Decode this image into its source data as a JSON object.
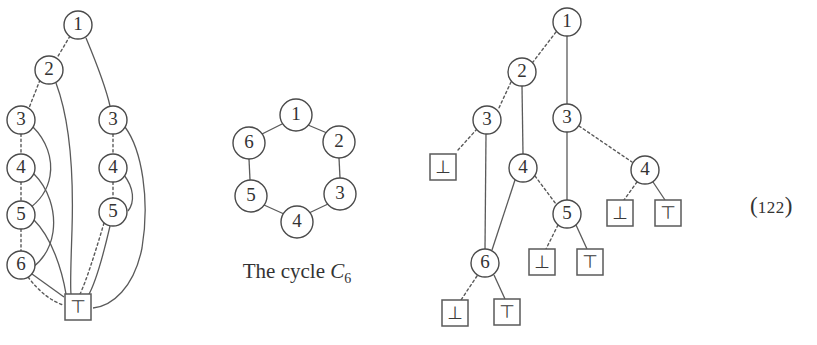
{
  "figure": {
    "equation_number": "(",
    "equation_number_digits": "122",
    "equation_number_close": ")"
  },
  "left_diagram": {
    "name": "bdd-unreduced-cycle-c6",
    "nodes": [
      {
        "id": "L1",
        "label": "1",
        "x": 78,
        "y": 25,
        "r": 14,
        "shape": "circle"
      },
      {
        "id": "L2",
        "label": "2",
        "x": 49,
        "y": 70,
        "r": 14,
        "shape": "circle"
      },
      {
        "id": "L3a",
        "label": "3",
        "x": 21,
        "y": 120,
        "r": 14,
        "shape": "circle"
      },
      {
        "id": "L3b",
        "label": "3",
        "x": 113,
        "y": 120,
        "r": 14,
        "shape": "circle"
      },
      {
        "id": "L4a",
        "label": "4",
        "x": 21,
        "y": 168,
        "r": 14,
        "shape": "circle"
      },
      {
        "id": "L4b",
        "label": "4",
        "x": 113,
        "y": 168,
        "r": 14,
        "shape": "circle"
      },
      {
        "id": "L5a",
        "label": "5",
        "x": 21,
        "y": 215,
        "r": 14,
        "shape": "circle"
      },
      {
        "id": "L5b",
        "label": "5",
        "x": 113,
        "y": 212,
        "r": 14,
        "shape": "circle"
      },
      {
        "id": "L6",
        "label": "6",
        "x": 21,
        "y": 265,
        "r": 14,
        "shape": "circle"
      },
      {
        "id": "LT",
        "label": "⊤",
        "x": 78,
        "y": 307,
        "w": 26,
        "h": 26,
        "shape": "box"
      }
    ]
  },
  "middle_diagram": {
    "name": "cycle-c6-graph",
    "caption_prefix": "The cycle ",
    "caption_symbol": "C",
    "caption_subscript": "6",
    "nodes": [
      {
        "id": "C1",
        "label": "1",
        "x": 296,
        "y": 115,
        "r": 16
      },
      {
        "id": "C2",
        "label": "2",
        "x": 339,
        "y": 142,
        "r": 16
      },
      {
        "id": "C3",
        "label": "3",
        "x": 340,
        "y": 194,
        "r": 16
      },
      {
        "id": "C4",
        "label": "4",
        "x": 297,
        "y": 222,
        "r": 16
      },
      {
        "id": "C5",
        "label": "5",
        "x": 251,
        "y": 196,
        "r": 16
      },
      {
        "id": "C6",
        "label": "6",
        "x": 249,
        "y": 143,
        "r": 16
      }
    ],
    "edges": [
      {
        "from": "C1",
        "to": "C2"
      },
      {
        "from": "C2",
        "to": "C3"
      },
      {
        "from": "C3",
        "to": "C4"
      },
      {
        "from": "C4",
        "to": "C5"
      },
      {
        "from": "C5",
        "to": "C6"
      },
      {
        "from": "C6",
        "to": "C1"
      }
    ]
  },
  "right_diagram": {
    "name": "bdd-reduced-cycle-c6",
    "nodes": [
      {
        "id": "R1",
        "label": "1",
        "x": 567,
        "y": 22,
        "r": 14,
        "shape": "circle"
      },
      {
        "id": "R2",
        "label": "2",
        "x": 522,
        "y": 72,
        "r": 14,
        "shape": "circle"
      },
      {
        "id": "R3a",
        "label": "3",
        "x": 487,
        "y": 120,
        "r": 14,
        "shape": "circle"
      },
      {
        "id": "R3b",
        "label": "3",
        "x": 567,
        "y": 118,
        "r": 14,
        "shape": "circle"
      },
      {
        "id": "R4a",
        "label": "4",
        "x": 523,
        "y": 168,
        "r": 14,
        "shape": "circle"
      },
      {
        "id": "R4b",
        "label": "4",
        "x": 645,
        "y": 170,
        "r": 14,
        "shape": "circle"
      },
      {
        "id": "R5",
        "label": "5",
        "x": 567,
        "y": 214,
        "r": 14,
        "shape": "circle"
      },
      {
        "id": "R6",
        "label": "6",
        "x": 485,
        "y": 263,
        "r": 14,
        "shape": "circle"
      },
      {
        "id": "B1",
        "label": "⊥",
        "x": 443,
        "y": 167,
        "w": 26,
        "h": 26,
        "shape": "box"
      },
      {
        "id": "B2",
        "label": "⊥",
        "x": 620,
        "y": 213,
        "w": 26,
        "h": 26,
        "shape": "box"
      },
      {
        "id": "B3",
        "label": "⊤",
        "x": 668,
        "y": 213,
        "w": 26,
        "h": 26,
        "shape": "box"
      },
      {
        "id": "B4",
        "label": "⊥",
        "x": 542,
        "y": 262,
        "w": 26,
        "h": 26,
        "shape": "box"
      },
      {
        "id": "B5",
        "label": "⊤",
        "x": 590,
        "y": 262,
        "w": 26,
        "h": 26,
        "shape": "box"
      },
      {
        "id": "B6",
        "label": "⊥",
        "x": 455,
        "y": 313,
        "w": 26,
        "h": 26,
        "shape": "box"
      },
      {
        "id": "B7",
        "label": "⊤",
        "x": 507,
        "y": 312,
        "w": 26,
        "h": 26,
        "shape": "box"
      }
    ],
    "edges": [
      {
        "from": "R1",
        "to": "R2",
        "style": "dashed"
      },
      {
        "from": "R1",
        "to": "R3b",
        "style": "solid"
      },
      {
        "from": "R2",
        "to": "R3a",
        "style": "dashed"
      },
      {
        "from": "R2",
        "to": "R4a",
        "style": "solid"
      },
      {
        "from": "R3a",
        "to": "B1",
        "style": "dashed"
      },
      {
        "from": "R3a",
        "to": "R6",
        "style": "solid"
      },
      {
        "from": "R3b",
        "to": "R4b",
        "style": "dashed"
      },
      {
        "from": "R3b",
        "to": "R5",
        "style": "solid"
      },
      {
        "from": "R4a",
        "to": "R5",
        "style": "dashed"
      },
      {
        "from": "R4a",
        "to": "R6",
        "style": "solid"
      },
      {
        "from": "R4b",
        "to": "B2",
        "style": "dashed"
      },
      {
        "from": "R4b",
        "to": "B3",
        "style": "solid"
      },
      {
        "from": "R5",
        "to": "B4",
        "style": "dashed"
      },
      {
        "from": "R5",
        "to": "B5",
        "style": "solid"
      },
      {
        "from": "R6",
        "to": "B6",
        "style": "dashed"
      },
      {
        "from": "R6",
        "to": "B7",
        "style": "solid"
      }
    ]
  }
}
